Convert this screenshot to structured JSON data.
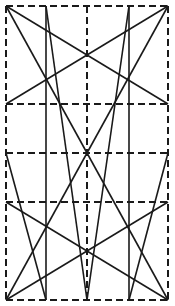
{
  "diagram": {
    "type": "geometric-construction",
    "width": 175,
    "height": 306,
    "colors": {
      "stroke": "#1a1a1a",
      "background": "#ffffff"
    },
    "frame": {
      "x1": 6,
      "y1": 6,
      "x2": 168,
      "y2": 300
    },
    "dashed_lines": [
      {
        "x1": 6,
        "y1": 6,
        "x2": 168,
        "y2": 6
      },
      {
        "x1": 6,
        "y1": 300,
        "x2": 168,
        "y2": 300
      },
      {
        "x1": 6,
        "y1": 6,
        "x2": 6,
        "y2": 300
      },
      {
        "x1": 168,
        "y1": 6,
        "x2": 168,
        "y2": 300
      },
      {
        "x1": 87,
        "y1": 6,
        "x2": 87,
        "y2": 300
      },
      {
        "x1": 6,
        "y1": 104,
        "x2": 168,
        "y2": 104
      },
      {
        "x1": 6,
        "y1": 153,
        "x2": 168,
        "y2": 153
      },
      {
        "x1": 6,
        "y1": 202,
        "x2": 168,
        "y2": 202
      }
    ],
    "solid_lines": [
      {
        "x1": 46,
        "y1": 6,
        "x2": 46,
        "y2": 300
      },
      {
        "x1": 129,
        "y1": 6,
        "x2": 129,
        "y2": 300
      },
      {
        "x1": 6,
        "y1": 6,
        "x2": 168,
        "y2": 104
      },
      {
        "x1": 168,
        "y1": 6,
        "x2": 6,
        "y2": 104
      },
      {
        "x1": 6,
        "y1": 300,
        "x2": 168,
        "y2": 202
      },
      {
        "x1": 168,
        "y1": 300,
        "x2": 6,
        "y2": 202
      },
      {
        "x1": 6,
        "y1": 6,
        "x2": 87,
        "y2": 153
      },
      {
        "x1": 168,
        "y1": 6,
        "x2": 87,
        "y2": 153
      },
      {
        "x1": 6,
        "y1": 300,
        "x2": 87,
        "y2": 153
      },
      {
        "x1": 168,
        "y1": 300,
        "x2": 87,
        "y2": 153
      },
      {
        "x1": 46,
        "y1": 6,
        "x2": 87,
        "y2": 300
      },
      {
        "x1": 129,
        "y1": 6,
        "x2": 87,
        "y2": 300
      },
      {
        "x1": 6,
        "y1": 153,
        "x2": 46,
        "y2": 300
      },
      {
        "x1": 168,
        "y1": 153,
        "x2": 129,
        "y2": 300
      },
      {
        "x1": 87,
        "y1": 6,
        "x2": 87,
        "y2": 6
      }
    ]
  }
}
